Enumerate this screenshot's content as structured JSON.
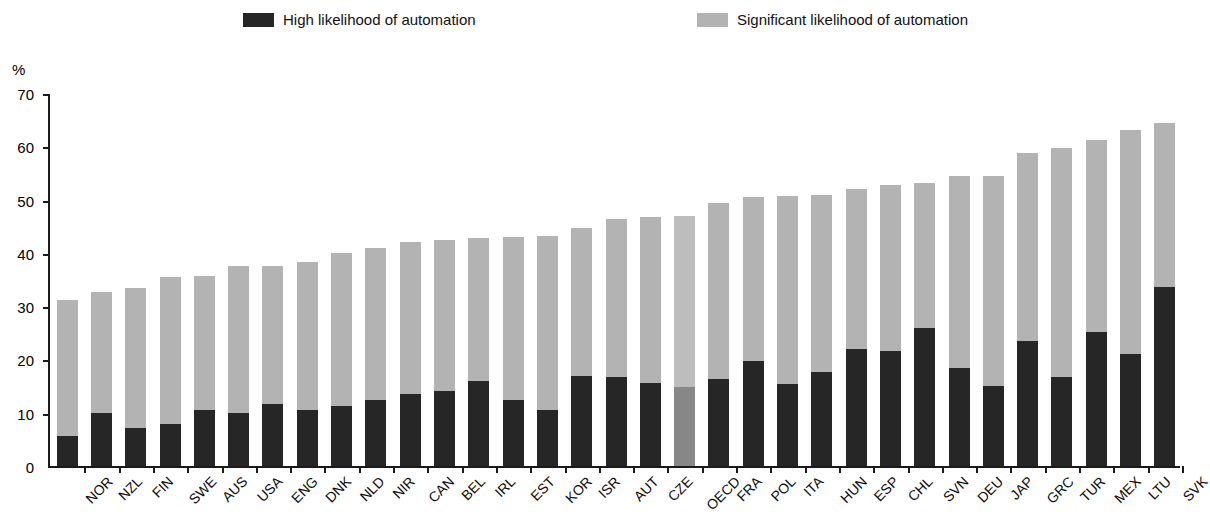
{
  "legend": {
    "items": [
      {
        "id": "high",
        "label": "High likelihood of automation",
        "color": "#262626"
      },
      {
        "id": "significant",
        "label": "Significant likelihood of automation",
        "color": "#b3b3b3"
      }
    ]
  },
  "axis": {
    "y_unit": "%",
    "y_ticks": [
      "0",
      "10",
      "20",
      "30",
      "40",
      "50",
      "60",
      "70"
    ]
  },
  "chart_data": {
    "type": "bar",
    "stacked": true,
    "title": "",
    "subtitle": "",
    "xlabel": "",
    "ylabel": "%",
    "ylim": [
      0,
      70
    ],
    "ytick_step": 10,
    "grid": false,
    "legend_position": "top",
    "highlight_category": "OECD",
    "categories": [
      "NOR",
      "NZL",
      "FIN",
      "SWE",
      "AUS",
      "USA",
      "ENG",
      "DNK",
      "NLD",
      "NIR",
      "CAN",
      "BEL",
      "IRL",
      "EST",
      "KOR",
      "ISR",
      "AUT",
      "CZE",
      "OECD",
      "FRA",
      "POL",
      "ITA",
      "HUN",
      "ESP",
      "CHL",
      "SVN",
      "DEU",
      "JAP",
      "GRC",
      "TUR",
      "MEX",
      "LTU",
      "SVK"
    ],
    "series": [
      {
        "name": "High likelihood of automation",
        "color": "#262626",
        "values": [
          5.7,
          9.9,
          7.2,
          7.9,
          10.6,
          9.9,
          11.7,
          10.6,
          11.3,
          12.3,
          13.5,
          14.1,
          15.9,
          12.3,
          10.5,
          16.8,
          16.7,
          15.5,
          14.9,
          16.3,
          19.8,
          15.3,
          17.6,
          21.9,
          21.6,
          25.9,
          18.4,
          15.1,
          23.4,
          16.7,
          25.1,
          21.0,
          33.6
        ]
      },
      {
        "name": "Significant likelihood of automation",
        "color": "#b3b3b3",
        "values": [
          25.5,
          22.8,
          26.2,
          27.5,
          25.1,
          27.6,
          25.9,
          27.6,
          28.7,
          28.6,
          28.5,
          28.3,
          26.8,
          30.7,
          32.6,
          27.9,
          29.7,
          31.3,
          32.0,
          33.1,
          30.7,
          35.3,
          33.3,
          30.1,
          31.2,
          27.2,
          36.0,
          39.3,
          35.4,
          42.9,
          36.0,
          42.0,
          30.8
        ]
      }
    ],
    "totals": [
      31.2,
      32.7,
      33.4,
      35.4,
      35.7,
      37.5,
      37.6,
      38.2,
      40.0,
      40.9,
      42.0,
      42.4,
      42.7,
      43.0,
      43.1,
      44.7,
      46.4,
      46.8,
      46.9,
      49.4,
      50.5,
      50.6,
      50.9,
      52.0,
      52.8,
      53.1,
      54.4,
      54.4,
      58.8,
      59.6,
      61.1,
      62.9,
      64.4
    ]
  }
}
